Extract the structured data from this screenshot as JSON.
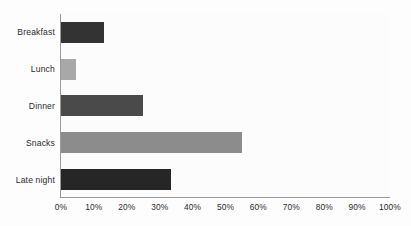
{
  "chart_data": {
    "type": "bar",
    "orientation": "horizontal",
    "title": "",
    "xlabel": "",
    "ylabel": "",
    "categories": [
      "Breakfast",
      "Lunch",
      "Dinner",
      "Snacks",
      "Late night"
    ],
    "values": [
      13,
      4.5,
      25,
      55,
      33.5
    ],
    "value_suffix": "%",
    "xlim": [
      0,
      100
    ],
    "xticks": [
      0,
      10,
      20,
      30,
      40,
      50,
      60,
      70,
      80,
      90,
      100
    ],
    "xtick_labels": [
      "0%",
      "10%",
      "20%",
      "30%",
      "40%",
      "50%",
      "60%",
      "70%",
      "80%",
      "90%",
      "100%"
    ],
    "grid": false,
    "legend": "none",
    "bar_colors": [
      "#333333",
      "#a8a8a8",
      "#4a4a4a",
      "#8c8c8c",
      "#262626"
    ],
    "background_color": "#fcfcfc",
    "axis_color": "#9a9a9a"
  }
}
